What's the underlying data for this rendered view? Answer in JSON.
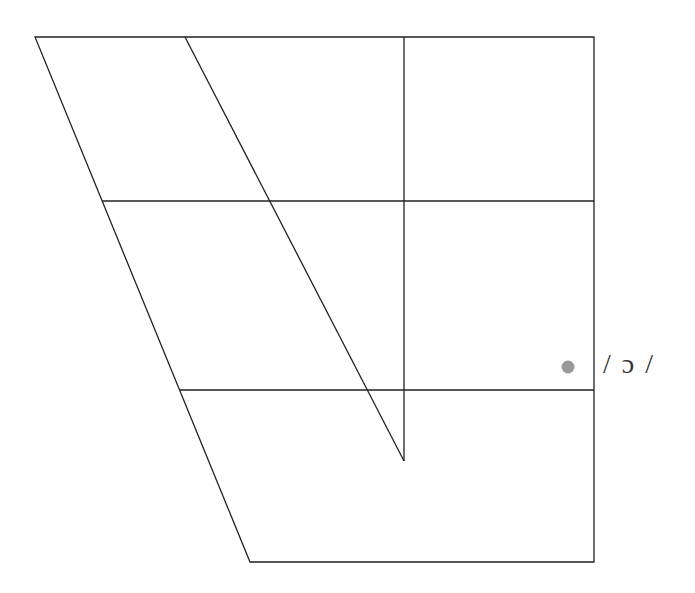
{
  "diagram": {
    "type": "vowel-chart",
    "line_color": "#222222",
    "outline": {
      "top_left": [
        35,
        37
      ],
      "top_right": [
        594,
        37
      ],
      "bottom_right": [
        594,
        562
      ],
      "bottom_left": [
        250,
        562
      ]
    },
    "inner_diagonal": {
      "from": [
        185,
        37
      ],
      "to": [
        404,
        461
      ]
    },
    "center_vertical": {
      "from": [
        404,
        37
      ],
      "to": [
        404,
        461
      ]
    },
    "horizontals": [
      {
        "from": [
          102,
          201
        ],
        "to": [
          594,
          201
        ]
      },
      {
        "from": [
          180,
          390
        ],
        "to": [
          594,
          390
        ]
      }
    ],
    "points": [
      {
        "symbol": "/ ɔ /",
        "x": 568,
        "y": 367,
        "color": "#999999"
      }
    ]
  }
}
